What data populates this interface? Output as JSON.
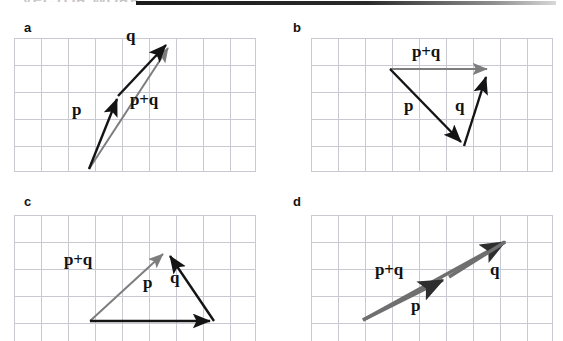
{
  "page": {
    "width": 563,
    "height": 341,
    "background": "#ffffff",
    "header_ghost_text": "VECTOR WORK",
    "grid_line_color": "#c9c9d2",
    "vector_black": "#141414",
    "vector_gray": "#7d7d7d"
  },
  "figure": {
    "caption_labels": [
      "a",
      "b",
      "c",
      "d"
    ],
    "vector_names": {
      "p": "p",
      "q": "q",
      "sum": "p+q"
    }
  },
  "panels": [
    {
      "id": "a",
      "label": "a",
      "grid": {
        "x": 14,
        "y": 38,
        "width": 242,
        "height": 134,
        "cell": 27
      },
      "description": "p and q drawn head-to-tail nearly vertical; resultant p+q from tail of p to head of q",
      "vectors": [
        {
          "name": "p",
          "label": "p",
          "color": "black",
          "from": [
            89,
            169
          ],
          "to": [
            118,
            96
          ],
          "label_pos": [
            72,
            112
          ]
        },
        {
          "name": "q",
          "label": "q",
          "color": "black",
          "from": [
            118,
            96
          ],
          "to": [
            168,
            42
          ],
          "label_pos": [
            128,
            35
          ]
        },
        {
          "name": "p+q",
          "label": "p+q",
          "color": "gray",
          "from": [
            89,
            169
          ],
          "to": [
            170,
            45
          ],
          "label_pos": [
            130,
            100
          ]
        }
      ]
    },
    {
      "id": "b",
      "label": "b",
      "grid": {
        "x": 311,
        "y": 38,
        "width": 242,
        "height": 134,
        "cell": 27
      },
      "description": "p points down-right, q points up-right, resultant p+q is horizontal to the right",
      "vectors": [
        {
          "name": "p",
          "label": "p",
          "color": "black",
          "from": [
            390,
            69
          ],
          "to": [
            464,
            146
          ],
          "label_pos": [
            404,
            104
          ]
        },
        {
          "name": "q",
          "label": "q",
          "color": "black",
          "from": [
            464,
            146
          ],
          "to": [
            488,
            73
          ],
          "label_pos": [
            455,
            103
          ]
        },
        {
          "name": "p+q",
          "label": "p+q",
          "color": "gray",
          "from": [
            390,
            69
          ],
          "to": [
            492,
            69
          ],
          "label_pos": [
            414,
            40
          ]
        }
      ]
    },
    {
      "id": "c",
      "label": "c",
      "grid": {
        "x": 14,
        "y": 215,
        "width": 242,
        "height": 126,
        "cell": 27
      },
      "description": "p points horizontally right, q points up-left, resultant p+q goes up-right",
      "vectors": [
        {
          "name": "p",
          "label": "p",
          "color": "black",
          "from": [
            90,
            321
          ],
          "to": [
            214,
            321
          ],
          "label_pos": [
            143,
            281
          ]
        },
        {
          "name": "q",
          "label": "q",
          "color": "black",
          "from": [
            214,
            321
          ],
          "to": [
            167,
            251
          ],
          "label_pos": [
            168,
            272
          ]
        },
        {
          "name": "p+q",
          "label": "p+q",
          "color": "gray",
          "from": [
            90,
            321
          ],
          "to": [
            165,
            250
          ],
          "label_pos": [
            72,
            250
          ]
        }
      ]
    },
    {
      "id": "d",
      "label": "d",
      "grid": {
        "x": 311,
        "y": 215,
        "width": 242,
        "height": 126,
        "cell": 27
      },
      "description": "p and q are parallel and collinear pointing up-right; p+q lies along the same line",
      "vectors": [
        {
          "name": "p",
          "label": "p",
          "color": "gray",
          "from": [
            363,
            320
          ],
          "to": [
            447,
            278
          ],
          "label_pos": [
            415,
            289
          ]
        },
        {
          "name": "q",
          "label": "q",
          "color": "gray",
          "from": [
            447,
            278
          ],
          "to": [
            508,
            240
          ],
          "label_pos": [
            496,
            270
          ]
        },
        {
          "name": "p+q",
          "label": "p+q",
          "color": "gray",
          "from": [
            363,
            320
          ],
          "to": [
            510,
            239
          ],
          "label_pos": [
            381,
            256
          ]
        }
      ]
    }
  ]
}
